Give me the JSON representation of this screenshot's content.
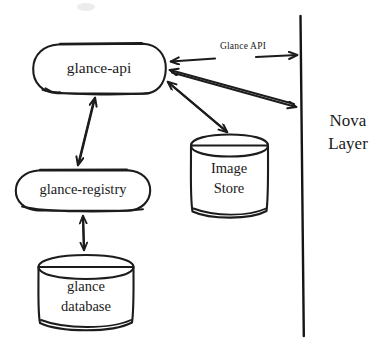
{
  "diagram": {
    "style": "hand-drawn sketch",
    "background_color": "#ffffff",
    "ink_color": "#1c1c1c",
    "nodes": [
      {
        "id": "glance-api",
        "label": "glance-api",
        "shape": "rounded-rectangle",
        "x": 99,
        "y": 68,
        "width": 132,
        "height": 50
      },
      {
        "id": "glance-registry",
        "label": "glance-registry",
        "shape": "rounded-rectangle",
        "x": 83,
        "y": 190,
        "width": 135,
        "height": 42
      },
      {
        "id": "image-store",
        "label_line1": "Image",
        "label_line2": "Store",
        "shape": "cylinder",
        "x": 229,
        "y": 176,
        "width": 78,
        "height": 82
      },
      {
        "id": "glance-database",
        "label_line1": "glance",
        "label_line2": "database",
        "shape": "cylinder",
        "x": 86,
        "y": 292,
        "width": 97,
        "height": 76
      }
    ],
    "boundary": {
      "id": "nova-boundary",
      "label_line1": "Nova",
      "label_line2": "Layer",
      "label_x": 348,
      "label_y": 122,
      "line_top_x": 300,
      "line_top_y": 16,
      "line_bottom_x": 304,
      "line_bottom_y": 336
    },
    "edges": [
      {
        "id": "glance-api-edge",
        "label": "Glance API",
        "from": "nova-boundary",
        "to": "glance-api",
        "arrow": "both",
        "label_x": 243,
        "label_y": 47
      },
      {
        "id": "api-to-nova",
        "label": "",
        "from": "glance-api",
        "to": "nova-boundary",
        "arrow": "both"
      },
      {
        "id": "api-to-store",
        "label": "",
        "from": "glance-api",
        "to": "image-store",
        "arrow": "both"
      },
      {
        "id": "api-to-registry",
        "label": "",
        "from": "glance-api",
        "to": "glance-registry",
        "arrow": "both"
      },
      {
        "id": "registry-to-database",
        "label": "",
        "from": "glance-registry",
        "to": "glance-database",
        "arrow": "both"
      }
    ]
  }
}
